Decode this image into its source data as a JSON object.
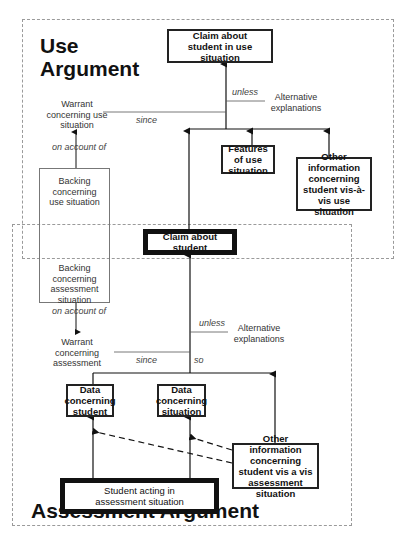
{
  "use_argument": {
    "title_line1": "Use",
    "title_line2": "Argument",
    "claim_in_use": "Claim about student in use situation",
    "unless_label": "unless",
    "alternative_explanations": "Alternative explanations",
    "warrant": "Warrant concerning use situation",
    "since_label": "since",
    "on_account_of": "on account of",
    "backing": "Backing concerning use situation",
    "features": "Features of use situation",
    "other_info": "Other information concerning student vis-à-vis use situation"
  },
  "shared": {
    "claim_about_student": "Claim about student"
  },
  "assessment_argument": {
    "title": "Assessment Argument",
    "backing": "Backing concerning assessment situation",
    "on_account_of": "on account of",
    "warrant": "Warrant concerning assessment",
    "since_label": "since",
    "so_label": "so",
    "unless_label": "unless",
    "alternative_explanations": "Alternative explanations",
    "data_student": "Data concerning student",
    "data_situation": "Data concerning situation",
    "other_info": "Other information concerning student vis a vis assessment situation",
    "student_acting": "Student acting in assessment situation"
  }
}
